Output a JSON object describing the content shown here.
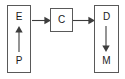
{
  "diagram": {
    "type": "flow-diagram",
    "background_color": "#ffffff",
    "stroke_color": "#595959",
    "arrow_color": "#3d3d3d",
    "text_color": "#1a1a1a",
    "nodes": [
      {
        "id": "left",
        "shape": "rectangle",
        "orientation": "vertical",
        "top_label": "E",
        "bottom_label": "P",
        "internal_arrow": "up"
      },
      {
        "id": "middle",
        "shape": "rectangle",
        "orientation": "square",
        "label": "C"
      },
      {
        "id": "right",
        "shape": "rectangle",
        "orientation": "vertical",
        "top_label": "D",
        "bottom_label": "M",
        "internal_arrow": "down"
      }
    ],
    "connectors": [
      {
        "id": "left-to-middle",
        "from": "left",
        "to": "middle",
        "direction": "right"
      },
      {
        "id": "middle-to-right",
        "from": "middle",
        "to": "right",
        "direction": "right"
      }
    ]
  }
}
